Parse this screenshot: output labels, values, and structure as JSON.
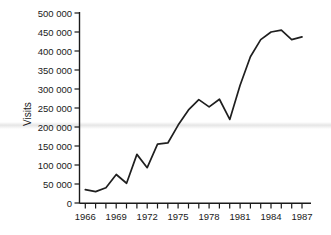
{
  "chart_data": {
    "type": "line",
    "title": "",
    "xlabel": "",
    "ylabel": "Visits",
    "x": [
      1966,
      1967,
      1968,
      1969,
      1970,
      1971,
      1972,
      1973,
      1974,
      1975,
      1976,
      1977,
      1978,
      1979,
      1980,
      1981,
      1982,
      1983,
      1984,
      1985,
      1986,
      1987
    ],
    "values": [
      35000,
      30000,
      40000,
      75000,
      52000,
      128000,
      93000,
      155000,
      158000,
      205000,
      245000,
      272000,
      253000,
      273000,
      220000,
      310000,
      385000,
      430000,
      450000,
      455000,
      430000,
      437000
    ],
    "series": [
      {
        "name": "Visits",
        "values": [
          35000,
          30000,
          40000,
          75000,
          52000,
          128000,
          93000,
          155000,
          158000,
          205000,
          245000,
          272000,
          253000,
          273000,
          220000,
          310000,
          385000,
          430000,
          450000,
          455000,
          430000,
          437000
        ]
      }
    ],
    "xlim": [
      1966,
      1987
    ],
    "ylim": [
      0,
      500000
    ],
    "ytick_values": [
      0,
      50000,
      100000,
      150000,
      200000,
      250000,
      300000,
      350000,
      400000,
      450000,
      500000
    ],
    "ytick_labels": [
      "0",
      "50 000",
      "100 000",
      "150 000",
      "200 000",
      "250 000",
      "300 000",
      "350 000",
      "400 000",
      "450 000",
      "500 000"
    ],
    "xtick_values": [
      1966,
      1967,
      1968,
      1969,
      1970,
      1971,
      1972,
      1973,
      1974,
      1975,
      1976,
      1977,
      1978,
      1979,
      1980,
      1981,
      1982,
      1983,
      1984,
      1985,
      1986,
      1987
    ],
    "xtick_labels_shown": [
      "1966",
      "1969",
      "1972",
      "1975",
      "1978",
      "1981",
      "1984",
      "1987"
    ],
    "xtick_labeled_values": [
      1966,
      1969,
      1972,
      1975,
      1978,
      1981,
      1984,
      1987
    ],
    "grid": false,
    "legend": false,
    "legend_position": "none",
    "line_color": "#1f1f1f",
    "axis_color": "#1a1a1a",
    "background_color": "#ffffff",
    "annotations": []
  },
  "axis": {
    "y_title": "Visits"
  },
  "ticks": {
    "y": [
      {
        "label": "500 000",
        "value": 500000
      },
      {
        "label": "450 000",
        "value": 450000
      },
      {
        "label": "400 000",
        "value": 400000
      },
      {
        "label": "350 000",
        "value": 350000
      },
      {
        "label": "300 000",
        "value": 300000
      },
      {
        "label": "250 000",
        "value": 250000
      },
      {
        "label": "200 000",
        "value": 200000
      },
      {
        "label": "150 000",
        "value": 150000
      },
      {
        "label": "100 000",
        "value": 100000
      },
      {
        "label": "50 000",
        "value": 50000
      },
      {
        "label": "0",
        "value": 0
      }
    ],
    "x": [
      {
        "label": "1966",
        "value": 1966
      },
      {
        "label": "1969",
        "value": 1969
      },
      {
        "label": "1972",
        "value": 1972
      },
      {
        "label": "1975",
        "value": 1975
      },
      {
        "label": "1978",
        "value": 1978
      },
      {
        "label": "1981",
        "value": 1981
      },
      {
        "label": "1984",
        "value": 1984
      },
      {
        "label": "1987",
        "value": 1987
      }
    ]
  }
}
